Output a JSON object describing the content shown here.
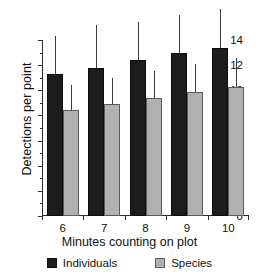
{
  "chart_data": {
    "type": "bar",
    "title": "",
    "xlabel": "Minutes counting on plot",
    "ylabel": "Detections per point",
    "categories": [
      "6",
      "7",
      "8",
      "9",
      "10"
    ],
    "ylim": [
      0,
      14
    ],
    "ytick_labels": [
      "0",
      "2",
      "4",
      "6",
      "8",
      "10",
      "12",
      "14"
    ],
    "ytick_values": [
      0,
      2,
      4,
      6,
      8,
      10,
      12,
      14
    ],
    "yminor_values": [
      1,
      3,
      5,
      7,
      9,
      11,
      13
    ],
    "grid": false,
    "legend_position": "bottom",
    "series": [
      {
        "name": "Individuals",
        "color": "#1c1c1c",
        "values": [
          11.3,
          11.8,
          12.4,
          13.0,
          13.4
        ],
        "error_high": [
          14.3,
          15.2,
          15.4,
          16.0,
          16.5
        ]
      },
      {
        "name": "Species",
        "color": "#b0b0b0",
        "values": [
          8.4,
          8.9,
          9.4,
          9.9,
          10.25
        ],
        "error_high": [
          10.4,
          11.0,
          11.5,
          12.1,
          12.6
        ]
      }
    ]
  }
}
